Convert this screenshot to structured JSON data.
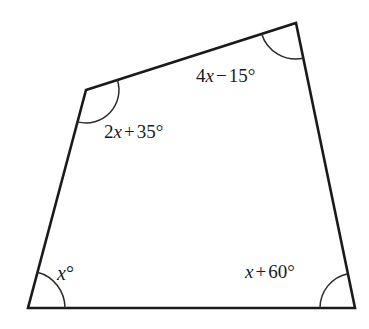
{
  "figure": {
    "name": "quadrilateral-angle-diagram",
    "type": "geometry-figure",
    "shape": "quadrilateral",
    "background_color": "#ffffff",
    "stroke_color": "#1a1a1a",
    "arc_color": "#2b2b2b",
    "vertices": [
      {
        "id": "top-left",
        "x": 86,
        "y": 90
      },
      {
        "id": "top-right",
        "x": 296,
        "y": 23
      },
      {
        "id": "bottom-right",
        "x": 355,
        "y": 308
      },
      {
        "id": "bottom-left",
        "x": 28,
        "y": 308
      }
    ],
    "edges": [
      {
        "from": "top-left",
        "to": "top-right"
      },
      {
        "from": "top-right",
        "to": "bottom-right"
      },
      {
        "from": "bottom-right",
        "to": "bottom-left"
      },
      {
        "from": "bottom-left",
        "to": "top-left"
      }
    ],
    "angles": [
      {
        "id": "top-right",
        "vertex": "top-right",
        "arc_radius": 36,
        "label": {
          "coefficient": "4",
          "variable": "x",
          "operator": "−",
          "constant": "15",
          "degree": "°"
        },
        "label_text": "4x − 15°"
      },
      {
        "id": "top-left",
        "vertex": "top-left",
        "arc_radius": 33,
        "label": {
          "coefficient": "2",
          "variable": "x",
          "operator": "+",
          "constant": "35",
          "degree": "°"
        },
        "label_text": "2x + 35°"
      },
      {
        "id": "bottom-left",
        "vertex": "bottom-left",
        "arc_radius": 37,
        "label": {
          "coefficient": "",
          "variable": "x",
          "operator": "",
          "constant": "",
          "degree": "°"
        },
        "label_text": "x°"
      },
      {
        "id": "bottom-right",
        "vertex": "bottom-right",
        "arc_radius": 35,
        "label": {
          "coefficient": "",
          "variable": "x",
          "operator": "+",
          "constant": "60",
          "degree": "°"
        },
        "label_text": "x + 60°"
      }
    ]
  }
}
